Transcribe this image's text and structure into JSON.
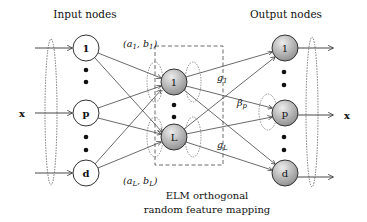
{
  "diagram": {
    "title_input": "Input nodes",
    "title_output": "Output nodes",
    "input_label": "x",
    "output_label": "x",
    "input_nodes": [
      {
        "label": "1",
        "cx": 86,
        "cy": 48
      },
      {
        "label": "p",
        "cx": 86,
        "cy": 113
      },
      {
        "label": "d",
        "cx": 86,
        "cy": 173
      }
    ],
    "hidden_nodes": [
      {
        "label": "1",
        "cx": 174,
        "cy": 82
      },
      {
        "label": "L",
        "cx": 174,
        "cy": 137
      }
    ],
    "output_nodes": [
      {
        "label": "1",
        "cx": 285,
        "cy": 48
      },
      {
        "label": "p",
        "cx": 285,
        "cy": 113
      },
      {
        "label": "d",
        "cx": 285,
        "cy": 173
      }
    ],
    "annotations": {
      "a1_b1": {
        "text_a": "(a",
        "sub_a": "1",
        "text_mid": ", b",
        "sub_b": "1",
        "text_end": ")"
      },
      "aL_bL": {
        "text_a": "(a",
        "sub_a": "L",
        "text_mid": ", b",
        "sub_b": "L",
        "text_end": ")"
      },
      "g1": {
        "text": "g",
        "sub": "1"
      },
      "gL": {
        "text": "g",
        "sub": "L"
      },
      "beta_p": {
        "text": "β",
        "sub": "p"
      }
    },
    "caption_line1": "ELM orthogonal",
    "caption_line2": "random feature mapping",
    "colors": {
      "stroke": "#333333",
      "node_fill_input": "#ffffff",
      "node_fill_gray_light": "#e4e4e4",
      "node_fill_gray_dark": "#8f8f8f",
      "dashed": "#555555"
    }
  }
}
